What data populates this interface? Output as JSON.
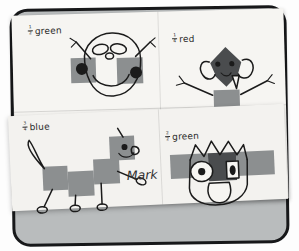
{
  "artwork": {
    "title": "Fraction shape art worksheet",
    "signature": "Mark",
    "paper_color": "#f6f5f2",
    "square_color": "#8c8f90",
    "dark_square_color": "#4a4c4e",
    "ink_color": "#1b1b1b",
    "frame_color": "#17181a",
    "desk_color": "#9fa3a4"
  },
  "quadrants": [
    {
      "id": "top-left",
      "fraction_numerator": "1",
      "fraction_denominator": "2",
      "color_word": "green",
      "figure_name": "antenna-face-drawing",
      "description": "Round face with two gray squares over the eyes, black pupils, two antennae and a smile"
    },
    {
      "id": "top-right",
      "fraction_numerator": "1",
      "fraction_denominator": "4",
      "color_word": "red",
      "figure_name": "diamond-head-creature-drawing",
      "description": "Diamond dark head with ears and fangs on a blocky gray body with stick arms and feet"
    },
    {
      "id": "bottom-left",
      "fraction_numerator": "3",
      "fraction_denominator": "4",
      "color_word": "blue",
      "figure_name": "square-dog-drawing",
      "description": "Dog made of gray squares with a curved tail, four stick legs and a smiling face"
    },
    {
      "id": "bottom-right",
      "fraction_numerator": "2",
      "fraction_denominator": "2",
      "color_word": "green",
      "figure_name": "spiky-hair-face-drawing",
      "description": "Wide face with spiky crown hair, big round eyes, gray square band and a muzzle"
    }
  ]
}
